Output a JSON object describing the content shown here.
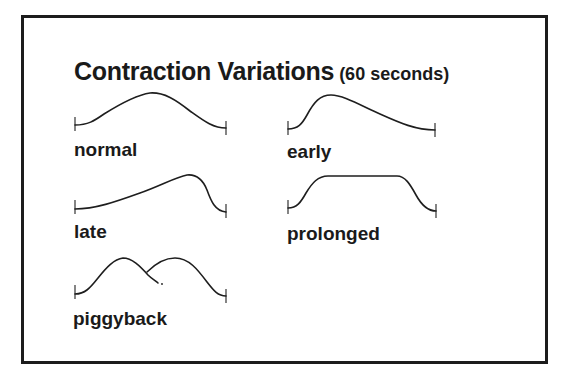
{
  "title": {
    "main": "Contraction Variations",
    "subtitle": "(60 seconds)"
  },
  "curves": [
    {
      "id": "normal",
      "label": "normal"
    },
    {
      "id": "early",
      "label": "early"
    },
    {
      "id": "late",
      "label": "late"
    },
    {
      "id": "prolonged",
      "label": "prolonged"
    },
    {
      "id": "piggyback",
      "label": "piggyback"
    }
  ],
  "colors": {
    "stroke": "#1e1e1e",
    "frame": "#1c1c1c",
    "background": "#ffffff"
  }
}
